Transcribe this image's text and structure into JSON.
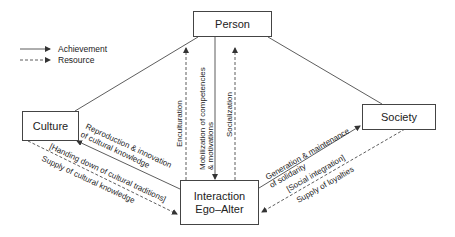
{
  "legend": {
    "achievement": "Achievement",
    "resource": "Resource"
  },
  "nodes": {
    "person": "Person",
    "culture": "Culture",
    "society": "Society",
    "interaction_line1": "Interaction",
    "interaction_line2": "Ego–Alter"
  },
  "edges": {
    "enculturation": "Enculturation",
    "mobilization_line1": "Mobilization of competencies",
    "mobilization_line2": "& motivations",
    "socialization": "Socialization",
    "reproduction_line1": "Reproduction & innovation",
    "reproduction_line2": "of cultural knowledge",
    "handing_down": "[Handing down of cultural traditions]",
    "supply_cultural": "Supply of cultural knowledge",
    "generation_line1": "Generation & maintenance",
    "generation_line2": "of solidarity",
    "social_integration": "[Social integration]",
    "supply_loyalties": "Supply of loyalties"
  },
  "colors": {
    "line": "#333333",
    "text": "#222222",
    "background": "#ffffff"
  }
}
